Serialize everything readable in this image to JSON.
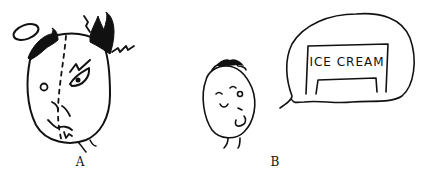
{
  "figure": {
    "panels": [
      {
        "id": "A",
        "label": "A",
        "description": "angry half-devil, half-angel face",
        "elements": [
          "halo",
          "devil-horn-hair",
          "lightning-bolts",
          "angry-eye",
          "calm-eye",
          "split-line",
          "frown-mouth"
        ]
      },
      {
        "id": "B",
        "label": "B",
        "description": "happy face thinking of ice cream",
        "thought_bubble": {
          "sign_text": "ICE CREAM"
        }
      }
    ],
    "colors": {
      "ink": "#111111",
      "background": "#ffffff"
    }
  }
}
